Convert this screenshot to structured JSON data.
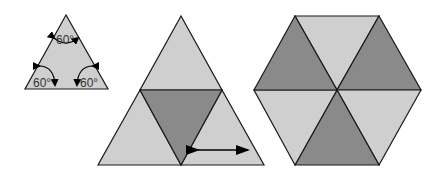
{
  "colors": {
    "light": "#cfcfcf",
    "dark": "#8a8a8a",
    "stroke": "#1a1a1a",
    "arrow": "#000000"
  },
  "figure1": {
    "description": "Equilateral triangle with all three interior angles labeled",
    "angle_labels": {
      "top": "60°",
      "bottom_left": "60°",
      "bottom_right": "60°"
    }
  },
  "figure2": {
    "description": "Large triangle subdivided into four triangles, middle inverted triangle shaded dark, double arrow in bottom-right triangle"
  },
  "figure3": {
    "description": "Regular hexagon divided into six triangles, alternating light and dark shading"
  }
}
